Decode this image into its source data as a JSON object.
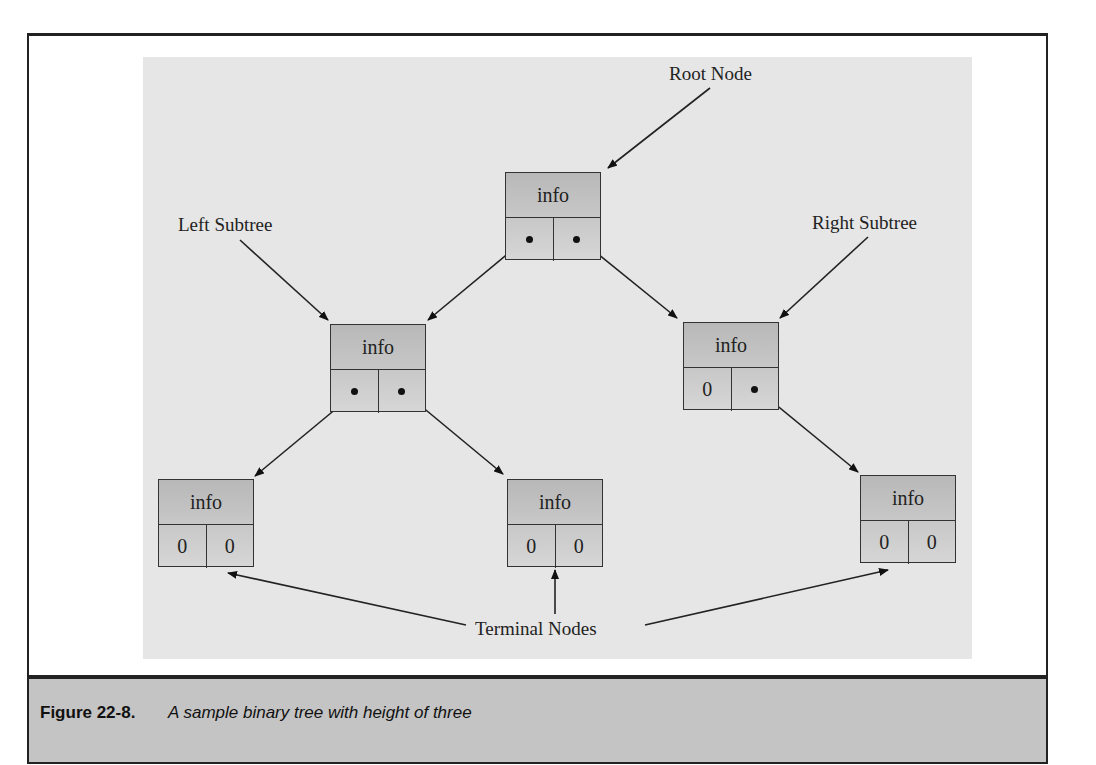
{
  "figure": {
    "number_label": "Figure 22-8.",
    "caption": "A sample binary tree with height of three"
  },
  "labels": {
    "root": "Root Node",
    "left_subtree": "Left Subtree",
    "right_subtree": "Right Subtree",
    "terminal": "Terminal Nodes"
  },
  "nodes": {
    "root": {
      "info": "info",
      "left": "",
      "right": ""
    },
    "left_child": {
      "info": "info",
      "left": "",
      "right": ""
    },
    "right_child": {
      "info": "info",
      "left": "0",
      "right": ""
    },
    "leaf_left_left": {
      "info": "info",
      "left": "0",
      "right": "0"
    },
    "leaf_left_right": {
      "info": "info",
      "left": "0",
      "right": "0"
    },
    "leaf_right_right": {
      "info": "info",
      "left": "0",
      "right": "0"
    }
  }
}
